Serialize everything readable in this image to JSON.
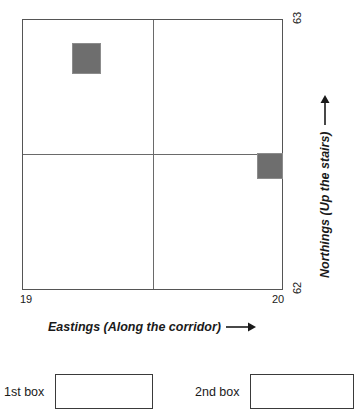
{
  "chart_data": {
    "type": "scatter",
    "title": "",
    "xlabel": "Eastings (Along the corridor)",
    "ylabel": "Northings (Up the stairs)",
    "xlim": [
      19,
      20
    ],
    "ylim": [
      62,
      63
    ],
    "x_ticks": [
      "19",
      "20"
    ],
    "y_ticks": [
      "62",
      "63"
    ],
    "grid": true,
    "gridlines": {
      "x": [
        19.5
      ],
      "y": [
        62.5
      ]
    },
    "markers": [
      {
        "name": "1st box",
        "x": 19.195,
        "y": 62.895,
        "width": 0.11,
        "height": 0.115,
        "color": "#6e6e6e"
      },
      {
        "name": "2nd box",
        "x": 19.93,
        "y": 62.41,
        "width": 0.1,
        "height": 0.095,
        "color": "#6e6e6e"
      }
    ],
    "legend": ""
  },
  "axes": {
    "x": {
      "title": "Eastings (Along the corridor)",
      "arrow": "right-arrow-icon",
      "min_label": "19",
      "max_label": "20"
    },
    "y": {
      "title": "Northings (Up the stairs)",
      "arrow": "up-arrow-icon",
      "min_label": "62",
      "max_label": "63"
    }
  },
  "answer_fields": [
    {
      "label": "1st box",
      "value": "",
      "placeholder": ""
    },
    {
      "label": "2nd box",
      "value": "",
      "placeholder": ""
    }
  ],
  "colors": {
    "marker_fill": "#6e6e6e",
    "plot_border": "#555555",
    "gridline": "#6a6a6a",
    "text": "#1a1a1a",
    "background": "#ffffff"
  }
}
